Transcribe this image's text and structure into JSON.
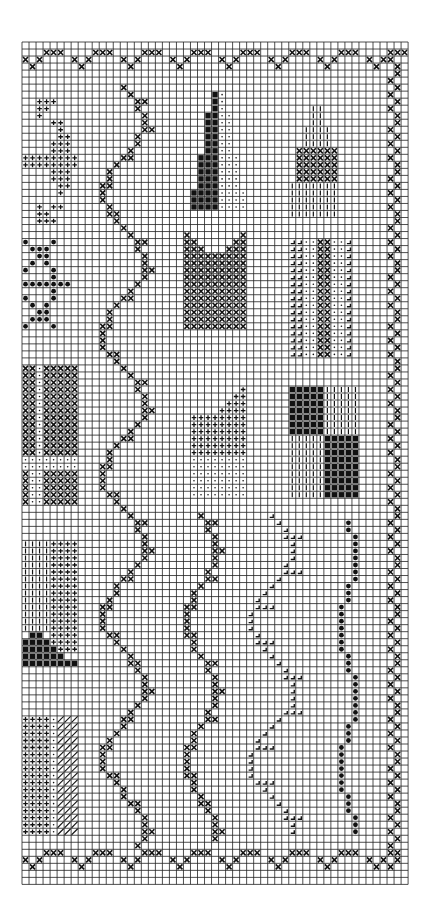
{
  "colors": {
    "background": "#ffffff",
    "grid": "#222222",
    "grid_major": "#111111",
    "ink": "#111111"
  },
  "grid": {
    "origin_x": 22,
    "origin_y": 42,
    "cell": 7.02,
    "cols": 55,
    "rows": 120
  },
  "symbols": {
    "x": "cross stitch",
    "plus": "plus stitch",
    "dot": "small dot",
    "bigdot": "large dot",
    "black": "solid fill",
    "vline": "vertical line",
    "hatch": "diagonal hatch",
    "ell": "corner mark"
  },
  "motifs": [
    {
      "name": "top-border",
      "symbol": "x",
      "kind": "border-h",
      "row": 2,
      "from": 0,
      "to": 54
    },
    {
      "name": "bottom-border",
      "symbol": "x",
      "kind": "border-h",
      "row": 116,
      "from": 0,
      "to": 52
    },
    {
      "name": "right-border",
      "symbol": "x",
      "kind": "border-v",
      "col": 52,
      "from": 2,
      "to": 117
    },
    {
      "name": "plus-star",
      "symbol": "plus",
      "cells": [
        [
          2,
          8
        ],
        [
          3,
          8
        ],
        [
          4,
          8
        ],
        [
          2,
          9
        ],
        [
          3,
          9
        ],
        [
          2,
          10
        ],
        [
          4,
          11
        ],
        [
          5,
          11
        ],
        [
          5,
          12
        ],
        [
          5,
          13
        ],
        [
          6,
          13
        ],
        [
          4,
          14
        ],
        [
          5,
          14
        ],
        [
          6,
          14
        ],
        [
          4,
          15
        ],
        [
          5,
          15
        ],
        [
          6,
          15
        ],
        [
          0,
          16
        ],
        [
          1,
          16
        ],
        [
          2,
          16
        ],
        [
          3,
          16
        ],
        [
          4,
          16
        ],
        [
          5,
          16
        ],
        [
          6,
          16
        ],
        [
          7,
          16
        ],
        [
          0,
          17
        ],
        [
          1,
          17
        ],
        [
          2,
          17
        ],
        [
          3,
          17
        ],
        [
          4,
          17
        ],
        [
          5,
          17
        ],
        [
          6,
          17
        ],
        [
          7,
          17
        ],
        [
          4,
          18
        ],
        [
          5,
          18
        ],
        [
          6,
          18
        ],
        [
          4,
          19
        ],
        [
          5,
          19
        ],
        [
          6,
          19
        ],
        [
          5,
          20
        ],
        [
          6,
          20
        ],
        [
          5,
          21
        ],
        [
          2,
          23
        ],
        [
          4,
          23
        ],
        [
          5,
          23
        ],
        [
          2,
          24
        ],
        [
          3,
          24
        ],
        [
          2,
          25
        ],
        [
          3,
          25
        ],
        [
          4,
          25
        ]
      ]
    },
    {
      "name": "dot-star",
      "symbol": "bigdot",
      "cells": [
        [
          0,
          28
        ],
        [
          4,
          28
        ],
        [
          1,
          29
        ],
        [
          2,
          29
        ],
        [
          3,
          29
        ],
        [
          2,
          30
        ],
        [
          3,
          30
        ],
        [
          1,
          31
        ],
        [
          3,
          31
        ],
        [
          0,
          32
        ],
        [
          4,
          32
        ],
        [
          4,
          33
        ],
        [
          0,
          34
        ],
        [
          1,
          34
        ],
        [
          2,
          34
        ],
        [
          3,
          34
        ],
        [
          4,
          34
        ],
        [
          5,
          34
        ],
        [
          6,
          34
        ],
        [
          4,
          35
        ],
        [
          0,
          36
        ],
        [
          4,
          36
        ],
        [
          1,
          37
        ],
        [
          3,
          37
        ],
        [
          2,
          38
        ],
        [
          3,
          38
        ],
        [
          1,
          39
        ],
        [
          2,
          39
        ],
        [
          3,
          39
        ],
        [
          0,
          40
        ],
        [
          4,
          40
        ]
      ]
    },
    {
      "name": "left-x-block",
      "symbol": "x",
      "rect": [
        0,
        46,
        1,
        58
      ]
    },
    {
      "name": "left-x-block-2",
      "symbol": "x",
      "rect": [
        3,
        46,
        7,
        58
      ]
    },
    {
      "name": "left-dot-col",
      "symbol": "dot",
      "rect": [
        1,
        46,
        2,
        58
      ]
    },
    {
      "name": "left-dot-band",
      "symbol": "dot",
      "rect": [
        0,
        59,
        7,
        60
      ]
    },
    {
      "name": "left-x-block-3",
      "symbol": "x",
      "rect": [
        0,
        61,
        0,
        65
      ]
    },
    {
      "name": "left-dot-col-2",
      "symbol": "dot",
      "rect": [
        1,
        61,
        2,
        65
      ]
    },
    {
      "name": "left-x-block-4",
      "symbol": "x",
      "rect": [
        3,
        61,
        7,
        65
      ]
    },
    {
      "name": "left-vline-block",
      "symbol": "vline",
      "rect": [
        0,
        71,
        3,
        83
      ]
    },
    {
      "name": "left-plus-block",
      "symbol": "plus",
      "rect": [
        4,
        71,
        7,
        86
      ]
    },
    {
      "name": "left-black-base",
      "symbol": "black",
      "cells": [
        [
          1,
          84
        ],
        [
          2,
          84
        ],
        [
          0,
          85
        ],
        [
          1,
          85
        ],
        [
          2,
          85
        ],
        [
          3,
          85
        ],
        [
          0,
          86
        ],
        [
          1,
          86
        ],
        [
          2,
          86
        ],
        [
          3,
          86
        ],
        [
          4,
          86
        ],
        [
          0,
          87
        ],
        [
          1,
          87
        ],
        [
          2,
          87
        ],
        [
          3,
          87
        ],
        [
          4,
          87
        ],
        [
          5,
          87
        ],
        [
          0,
          88
        ],
        [
          1,
          88
        ],
        [
          2,
          88
        ],
        [
          3,
          88
        ],
        [
          4,
          88
        ],
        [
          5,
          88
        ],
        [
          6,
          88
        ],
        [
          7,
          88
        ]
      ]
    },
    {
      "name": "left-plus-block-2",
      "symbol": "plus",
      "rect": [
        0,
        96,
        3,
        112
      ]
    },
    {
      "name": "left-dot-col-3",
      "symbol": "dot",
      "rect": [
        4,
        96,
        4,
        112
      ]
    },
    {
      "name": "left-hatch-block",
      "symbol": "hatch",
      "rect": [
        5,
        96,
        7,
        112
      ]
    },
    {
      "name": "black-tower",
      "symbol": "black",
      "cells": [
        [
          27,
          7
        ],
        [
          27,
          8
        ],
        [
          27,
          9
        ],
        [
          26,
          10
        ],
        [
          27,
          10
        ],
        [
          26,
          11
        ],
        [
          27,
          11
        ],
        [
          26,
          12
        ],
        [
          27,
          12
        ],
        [
          26,
          13
        ],
        [
          27,
          13
        ],
        [
          26,
          14
        ],
        [
          27,
          14
        ],
        [
          26,
          15
        ],
        [
          27,
          15
        ],
        [
          25,
          16
        ],
        [
          26,
          16
        ],
        [
          27,
          16
        ],
        [
          25,
          17
        ],
        [
          26,
          17
        ],
        [
          27,
          17
        ],
        [
          25,
          18
        ],
        [
          26,
          18
        ],
        [
          27,
          18
        ],
        [
          25,
          19
        ],
        [
          26,
          19
        ],
        [
          27,
          19
        ],
        [
          25,
          20
        ],
        [
          26,
          20
        ],
        [
          27,
          20
        ],
        [
          24,
          21
        ],
        [
          25,
          21
        ],
        [
          26,
          21
        ],
        [
          27,
          21
        ],
        [
          24,
          22
        ],
        [
          25,
          22
        ],
        [
          26,
          22
        ],
        [
          27,
          22
        ],
        [
          24,
          23
        ],
        [
          25,
          23
        ],
        [
          26,
          23
        ],
        [
          27,
          23
        ]
      ]
    },
    {
      "name": "dot-tower",
      "symbol": "dot",
      "cells": [
        [
          28,
          7
        ],
        [
          28,
          8
        ],
        [
          28,
          9
        ],
        [
          28,
          10
        ],
        [
          29,
          10
        ],
        [
          28,
          11
        ],
        [
          29,
          11
        ],
        [
          28,
          12
        ],
        [
          29,
          12
        ],
        [
          28,
          13
        ],
        [
          29,
          13
        ],
        [
          28,
          14
        ],
        [
          29,
          14
        ],
        [
          28,
          15
        ],
        [
          29,
          15
        ],
        [
          28,
          16
        ],
        [
          29,
          16
        ],
        [
          30,
          16
        ],
        [
          28,
          17
        ],
        [
          29,
          17
        ],
        [
          30,
          17
        ],
        [
          28,
          18
        ],
        [
          29,
          18
        ],
        [
          30,
          18
        ],
        [
          28,
          19
        ],
        [
          29,
          19
        ],
        [
          30,
          19
        ],
        [
          28,
          20
        ],
        [
          29,
          20
        ],
        [
          30,
          20
        ],
        [
          28,
          21
        ],
        [
          29,
          21
        ],
        [
          30,
          21
        ],
        [
          31,
          21
        ],
        [
          28,
          22
        ],
        [
          29,
          22
        ],
        [
          30,
          22
        ],
        [
          31,
          22
        ],
        [
          28,
          23
        ],
        [
          29,
          23
        ],
        [
          30,
          23
        ],
        [
          31,
          23
        ]
      ]
    },
    {
      "name": "cupcake-top",
      "symbol": "vline",
      "cells": [
        [
          41,
          9
        ],
        [
          42,
          9
        ],
        [
          41,
          10
        ],
        [
          42,
          10
        ],
        [
          41,
          11
        ],
        [
          42,
          11
        ],
        [
          40,
          12
        ],
        [
          41,
          12
        ],
        [
          42,
          12
        ],
        [
          43,
          12
        ],
        [
          40,
          13
        ],
        [
          41,
          13
        ],
        [
          42,
          13
        ],
        [
          43,
          13
        ],
        [
          40,
          14
        ],
        [
          41,
          14
        ],
        [
          42,
          14
        ],
        [
          43,
          14
        ]
      ]
    },
    {
      "name": "cupcake-middle",
      "symbol": "x",
      "rect": [
        39,
        15,
        44,
        19
      ]
    },
    {
      "name": "cupcake-base",
      "symbol": "vline",
      "rect": [
        38,
        20,
        44,
        24
      ]
    },
    {
      "name": "x-v-block",
      "symbol": "x",
      "cells": [
        [
          23,
          27
        ],
        [
          31,
          27
        ],
        [
          23,
          28
        ],
        [
          24,
          28
        ],
        [
          30,
          28
        ],
        [
          31,
          28
        ],
        [
          23,
          29
        ],
        [
          24,
          29
        ],
        [
          25,
          29
        ],
        [
          29,
          29
        ],
        [
          30,
          29
        ],
        [
          31,
          29
        ]
      ],
      "rect2": [
        23,
        30,
        31,
        40
      ]
    },
    {
      "name": "ell-block-left",
      "symbol": "ell",
      "rect": [
        38,
        28,
        39,
        44
      ]
    },
    {
      "name": "dot-block-left",
      "symbol": "dot",
      "rect": [
        40,
        28,
        41,
        44
      ]
    },
    {
      "name": "x-column",
      "symbol": "x",
      "rect": [
        42,
        28,
        43,
        44
      ]
    },
    {
      "name": "dot-block-right",
      "symbol": "dot",
      "rect": [
        44,
        28,
        45,
        44
      ]
    },
    {
      "name": "ell-block-right",
      "symbol": "ell",
      "rect": [
        46,
        28,
        46,
        44
      ]
    },
    {
      "name": "plus-house",
      "symbol": "plus",
      "cells": [
        [
          31,
          49
        ],
        [
          30,
          50
        ],
        [
          31,
          50
        ],
        [
          29,
          51
        ],
        [
          30,
          51
        ],
        [
          31,
          51
        ],
        [
          28,
          52
        ],
        [
          29,
          52
        ],
        [
          30,
          52
        ],
        [
          31,
          52
        ]
      ],
      "rect2": [
        24,
        53,
        31,
        58
      ]
    },
    {
      "name": "dot-house-base",
      "symbol": "dot",
      "rect": [
        24,
        59,
        31,
        64
      ]
    },
    {
      "name": "checker-black-1",
      "symbol": "black",
      "rect": [
        38,
        49,
        42,
        55
      ]
    },
    {
      "name": "checker-vline-1",
      "symbol": "vline",
      "rect": [
        43,
        49,
        47,
        55
      ]
    },
    {
      "name": "checker-vline-2",
      "symbol": "vline",
      "rect": [
        38,
        56,
        42,
        64
      ]
    },
    {
      "name": "checker-black-2",
      "symbol": "black",
      "rect": [
        43,
        56,
        47,
        64
      ]
    },
    {
      "name": "vine-1",
      "symbol": "x",
      "kind": "vine",
      "col": 14,
      "from": 6,
      "to": 114,
      "amp": 3
    },
    {
      "name": "vine-2",
      "symbol": "x",
      "kind": "vine",
      "col": 25,
      "from": 67,
      "to": 113,
      "amp": 2
    },
    {
      "name": "ell-vine",
      "symbol": "ell",
      "kind": "vine",
      "col": 35,
      "from": 67,
      "to": 112,
      "amp": 3
    },
    {
      "name": "dot-vine",
      "symbol": "bigdot",
      "kind": "vine",
      "col": 46,
      "from": 68,
      "to": 112,
      "amp": 1
    }
  ]
}
